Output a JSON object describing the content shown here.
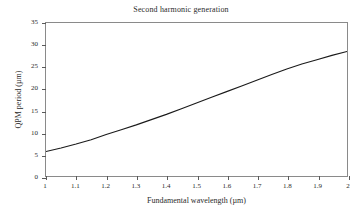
{
  "chart_data": {
    "type": "line",
    "title": "Second harmonic generation",
    "xlabel": "Fundamental wavelength (µm)",
    "ylabel": "QPM period (µm)",
    "xlim": [
      1,
      2
    ],
    "ylim": [
      0,
      35
    ],
    "xticks": [
      1,
      1.1,
      1.2,
      1.3,
      1.4,
      1.5,
      1.6,
      1.7,
      1.8,
      1.9,
      2
    ],
    "xtick_labels": [
      "1",
      "1.1",
      "1.2",
      "1.3",
      "1.4",
      "1.5",
      "1.6",
      "1.7",
      "1.8",
      "1.9",
      "2"
    ],
    "yticks": [
      0,
      5,
      10,
      15,
      20,
      25,
      30,
      35
    ],
    "ytick_labels": [
      "0",
      "5",
      "10",
      "15",
      "20",
      "25",
      "30",
      "35"
    ],
    "grid": false,
    "legend": false,
    "line_color": "#1a1a1a",
    "frame_color": "#8a8a8a",
    "series": [
      {
        "name": "QPM period",
        "x": [
          1.0,
          1.05,
          1.1,
          1.15,
          1.2,
          1.25,
          1.3,
          1.35,
          1.4,
          1.45,
          1.5,
          1.55,
          1.6,
          1.65,
          1.7,
          1.75,
          1.8,
          1.85,
          1.9,
          1.95,
          2.0
        ],
        "values": [
          5.6,
          6.4,
          7.3,
          8.3,
          9.5,
          10.6,
          11.7,
          12.9,
          14.1,
          15.4,
          16.7,
          18.0,
          19.3,
          20.6,
          21.9,
          23.2,
          24.5,
          25.6,
          26.6,
          27.6,
          28.5
        ]
      }
    ]
  }
}
